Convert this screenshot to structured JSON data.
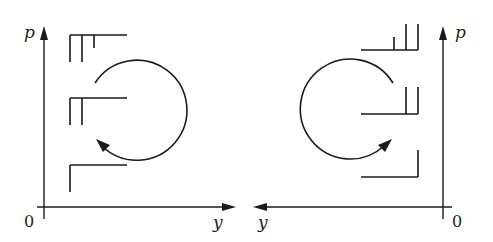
{
  "figure": {
    "panels": [
      {
        "id": "left",
        "y_axis_label": "p",
        "x_axis_label": "y",
        "origin_label": "0",
        "x_axis_direction": "right",
        "cycle_direction": "counterclockwise",
        "symbols": [
          {
            "position": "top",
            "vertical_ticks": 3
          },
          {
            "position": "middle",
            "vertical_ticks": 2
          },
          {
            "position": "bottom",
            "vertical_ticks": 1
          }
        ]
      },
      {
        "id": "right",
        "y_axis_label": "p",
        "x_axis_label": "y",
        "origin_label": "0",
        "x_axis_direction": "left",
        "cycle_direction": "clockwise",
        "symbols": [
          {
            "position": "top",
            "vertical_ticks": 3
          },
          {
            "position": "middle",
            "vertical_ticks": 2
          },
          {
            "position": "bottom",
            "vertical_ticks": 1
          }
        ]
      }
    ],
    "colors": {
      "ink": "#1a1a1a",
      "background": "#ffffff"
    }
  }
}
